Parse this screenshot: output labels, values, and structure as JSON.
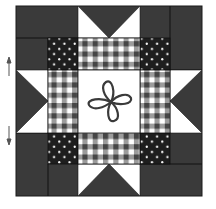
{
  "figure": {
    "center_motif": "four-petal flower outline",
    "colors": {
      "dark": "#3a3a3a",
      "line": "#1a1a1a",
      "light": "#ffffff",
      "gingham_dark": "#454545",
      "gingham_mid": "#9a9a9a",
      "polka_bg": "#1e1e1e",
      "polka_dot": "#ffffff",
      "flower": "#3a3a3a"
    },
    "arrows": [
      {
        "direction": "up",
        "label": ""
      },
      {
        "direction": "down",
        "label": ""
      }
    ]
  }
}
